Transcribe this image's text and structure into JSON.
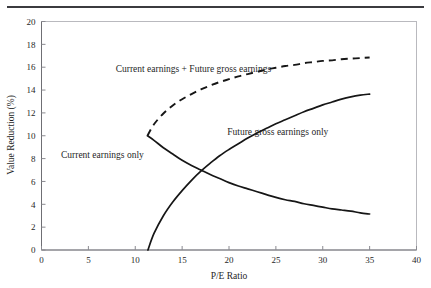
{
  "figure": {
    "top_rule": "horizontal-rule",
    "background_color": "#ffffff",
    "line_color": "#161616"
  },
  "chart_data": {
    "type": "line",
    "title": "",
    "subtitle": "",
    "xlabel": "P/E Ratio",
    "ylabel": "Value Reduction (%)",
    "xlim": [
      0,
      40
    ],
    "ylim": [
      0,
      20
    ],
    "xticks": [
      0,
      5,
      10,
      15,
      20,
      25,
      30,
      35,
      40
    ],
    "yticks": [
      0,
      2,
      4,
      6,
      8,
      10,
      12,
      14,
      16,
      18,
      20
    ],
    "xtick_labels": [
      "0",
      "5",
      "10",
      "15",
      "20",
      "25",
      "30",
      "35",
      "40"
    ],
    "ytick_labels": [
      "0",
      "2",
      "4",
      "6",
      "8",
      "10",
      "12",
      "14",
      "16",
      "18",
      "20"
    ],
    "grid": false,
    "legend_position": "inline-annotations",
    "series": [
      {
        "name": "Current earnings + Future gross earnings",
        "style": "dashed",
        "label_x": 16.2,
        "label_y": 15.6,
        "x": [
          11.3,
          12.0,
          13.0,
          14.0,
          15.0,
          16.0,
          17.0,
          18.0,
          19.0,
          20.0,
          21.0,
          22.0,
          23.0,
          24.0,
          25.0,
          26.0,
          27.0,
          28.0,
          29.0,
          30.0,
          31.0,
          32.0,
          33.0,
          34.0,
          35.0
        ],
        "y": [
          10.0,
          11.0,
          11.95,
          12.65,
          13.2,
          13.65,
          14.05,
          14.4,
          14.7,
          14.95,
          15.2,
          15.4,
          15.6,
          15.8,
          15.95,
          16.1,
          16.2,
          16.35,
          16.45,
          16.55,
          16.6,
          16.7,
          16.75,
          16.8,
          16.85
        ]
      },
      {
        "name": "Current earnings only",
        "style": "solid",
        "label_x": 6.5,
        "label_y": 8.1,
        "x": [
          11.3,
          12.0,
          13.0,
          14.0,
          15.0,
          16.0,
          17.0,
          18.0,
          19.0,
          20.0,
          21.0,
          22.0,
          23.0,
          24.0,
          25.0,
          26.0,
          27.0,
          28.0,
          29.0,
          30.0,
          31.0,
          32.0,
          33.0,
          34.0,
          35.0
        ],
        "y": [
          10.0,
          9.6,
          8.95,
          8.4,
          7.85,
          7.4,
          7.0,
          6.6,
          6.25,
          5.9,
          5.6,
          5.35,
          5.1,
          4.85,
          4.6,
          4.4,
          4.25,
          4.05,
          3.9,
          3.75,
          3.6,
          3.5,
          3.4,
          3.25,
          3.15
        ]
      },
      {
        "name": "Future gross earnings only",
        "style": "solid",
        "label_x": 25.2,
        "label_y": 10.1,
        "x": [
          11.35,
          12.0,
          13.0,
          14.0,
          15.0,
          16.0,
          17.0,
          18.0,
          19.0,
          20.0,
          21.0,
          22.0,
          23.0,
          24.0,
          25.0,
          26.0,
          27.0,
          28.0,
          29.0,
          30.0,
          31.0,
          32.0,
          33.0,
          34.0,
          35.0
        ],
        "y": [
          0.0,
          1.45,
          3.0,
          4.2,
          5.2,
          6.1,
          6.9,
          7.6,
          8.25,
          8.8,
          9.3,
          9.8,
          10.25,
          10.65,
          11.05,
          11.4,
          11.75,
          12.1,
          12.4,
          12.7,
          12.95,
          13.2,
          13.4,
          13.55,
          13.65
        ]
      }
    ],
    "annotations": [
      {
        "text": "Current earnings + Future gross earnings",
        "x": 16.2,
        "y": 15.6
      },
      {
        "text": "Current earnings only",
        "x": 6.5,
        "y": 8.1
      },
      {
        "text": "Future gross earnings only",
        "x": 25.2,
        "y": 10.1
      }
    ],
    "branch_point": {
      "x": 11.3,
      "y": 10.0
    },
    "crossing_point": {
      "x": 16.6,
      "y": 6.7
    }
  }
}
